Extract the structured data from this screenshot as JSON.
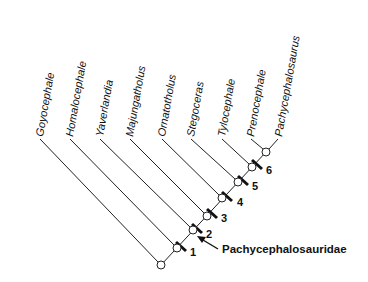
{
  "diagram": {
    "type": "cladogram",
    "taxa": [
      {
        "name": "Goyocephale",
        "x": 40
      },
      {
        "name": "Homalocephale",
        "x": 70
      },
      {
        "name": "Yaverlandia",
        "x": 100
      },
      {
        "name": "Majungatholus",
        "x": 130
      },
      {
        "name": "Ornatotholus",
        "x": 162
      },
      {
        "name": "Stegoceras",
        "x": 191
      },
      {
        "name": "Tylocephale",
        "x": 222
      },
      {
        "name": "Prenocephale",
        "x": 251
      },
      {
        "name": "Pachycephalosaurus",
        "x": 278
      }
    ],
    "node_labels": [
      "1",
      "2",
      "3",
      "4",
      "5",
      "6"
    ],
    "clade_label": "Pachycephalosauridae",
    "colors": {
      "line": "#222222",
      "text": "#111111",
      "background": "#ffffff"
    }
  }
}
